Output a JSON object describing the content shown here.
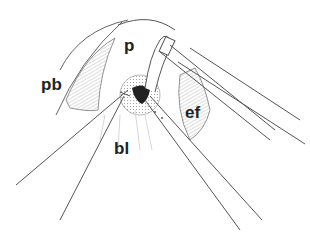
{
  "figure": {
    "type": "surgical line illustration",
    "labels": [
      {
        "id": "p",
        "text": "p",
        "x": 124,
        "y": 37
      },
      {
        "id": "pb",
        "text": "pb",
        "x": 41,
        "y": 76
      },
      {
        "id": "ef",
        "text": "ef",
        "x": 185,
        "y": 104
      },
      {
        "id": "bl",
        "text": "bl",
        "x": 114,
        "y": 140
      }
    ],
    "colors": {
      "line": "#555555",
      "hatch": "#bbbbbb",
      "dark": "#222222"
    }
  }
}
